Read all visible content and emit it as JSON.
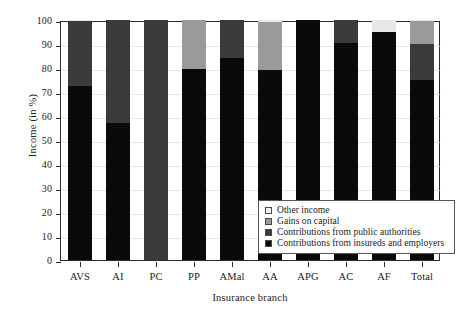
{
  "chart_data": {
    "type": "bar",
    "stacked": true,
    "title": "",
    "xlabel": "Insurance branch",
    "ylabel": "Income (in %)",
    "ylim": [
      0,
      100
    ],
    "yticks": [
      0,
      10,
      20,
      30,
      40,
      50,
      60,
      70,
      80,
      90,
      100
    ],
    "ytick_labels": [
      "0",
      "10",
      "20",
      "30",
      "40",
      "50",
      "60",
      "70",
      "80",
      "90",
      "100"
    ],
    "grid": false,
    "legend_position": "lower right",
    "categories": [
      "AVS",
      "AI",
      "PC",
      "PP",
      "AMal",
      "AA",
      "APG",
      "AC",
      "AF",
      "Total"
    ],
    "series": [
      {
        "name": "Contributions from insureds and employers",
        "color": "#0a0a0a",
        "values": [
          72.5,
          57.0,
          0.0,
          79.5,
          84.0,
          79.0,
          100.0,
          90.5,
          95.0,
          75.0
        ]
      },
      {
        "name": "Contributions from public authorities",
        "color": "#3a3a3a",
        "values": [
          27.0,
          43.0,
          100.0,
          0.0,
          16.0,
          0.0,
          0.0,
          9.5,
          0.0,
          15.0
        ]
      },
      {
        "name": "Gains on capital",
        "color": "#9a9a9a",
        "values": [
          0.0,
          0.0,
          0.0,
          20.5,
          0.0,
          20.0,
          0.0,
          0.0,
          0.0,
          9.5
        ]
      },
      {
        "name": "Other income",
        "color": "#e8e8e8",
        "values": [
          0.5,
          0.0,
          0.0,
          0.0,
          0.0,
          1.0,
          0.0,
          0.0,
          5.0,
          0.5
        ]
      }
    ],
    "legend_entries": [
      {
        "label": "Other income",
        "key": "other"
      },
      {
        "label": "Gains on capital",
        "key": "capital"
      },
      {
        "label": "Contributions from public authorities",
        "key": "public"
      },
      {
        "label": "Contributions from insureds and employers",
        "key": "insured"
      }
    ]
  }
}
